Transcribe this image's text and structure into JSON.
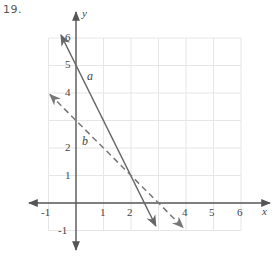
{
  "problem": {
    "number": "19."
  },
  "axes": {
    "x_label": "x",
    "y_label": "y",
    "x_ticks": [
      "-1",
      "1",
      "2",
      "4",
      "5",
      "6"
    ],
    "y_ticks": [
      "6",
      "5",
      "4",
      "2",
      "1",
      "-1"
    ],
    "xlim": [
      -1,
      6
    ],
    "ylim": [
      -1,
      6
    ]
  },
  "lines": [
    {
      "name": "a",
      "label": "a",
      "style": "solid",
      "equation": "y = -2x + 5",
      "color": "#666666"
    },
    {
      "name": "b",
      "label": "b",
      "style": "dashed",
      "equation": "y = -x + 3",
      "color": "#777777"
    }
  ],
  "intersection": {
    "x": 2,
    "y": 1
  },
  "colors": {
    "grid": "#e6e6e6",
    "axis": "#555555"
  }
}
